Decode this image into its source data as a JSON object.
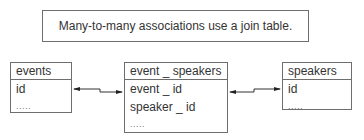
{
  "caption": "Many-to-many associations use a join table.",
  "tables": {
    "events": {
      "name": "events",
      "fields": [
        "id",
        "....."
      ]
    },
    "join": {
      "name": "event _ speakers",
      "fields": [
        "event _ id",
        "speaker _ id",
        "....."
      ]
    },
    "speakers": {
      "name": "speakers",
      "fields": [
        "id",
        "....."
      ]
    }
  },
  "connectors": [
    {
      "from": "events.id",
      "to": "event_speakers.event_id",
      "style": "double-arrow"
    },
    {
      "from": "event_speakers",
      "to": "speakers.id",
      "style": "double-arrow"
    }
  ],
  "colors": {
    "border": "#6e6e6e",
    "text": "#333333",
    "background": "#ffffff"
  }
}
